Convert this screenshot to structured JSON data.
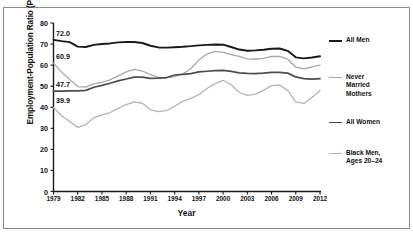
{
  "chart_data": {
    "type": "line",
    "title": "",
    "xlabel": "Year",
    "ylabel": "Employment-Population Ratio (Percent)",
    "xlim": [
      1979,
      2012
    ],
    "ylim": [
      0,
      80
    ],
    "grid": false,
    "legend_position": "right",
    "xticks": [
      "1979",
      "1982",
      "1985",
      "1988",
      "1991",
      "1994",
      "1997",
      "2000",
      "2003",
      "2006",
      "2009",
      "2012"
    ],
    "yticks": [
      "0",
      "10",
      "20",
      "30",
      "40",
      "50",
      "60",
      "70",
      "80"
    ],
    "x": [
      1979,
      1980,
      1981,
      1982,
      1983,
      1984,
      1985,
      1986,
      1987,
      1988,
      1989,
      1990,
      1991,
      1992,
      1993,
      1994,
      1995,
      1996,
      1997,
      1998,
      1999,
      2000,
      2001,
      2002,
      2003,
      2004,
      2005,
      2006,
      2007,
      2008,
      2009,
      2010,
      2011,
      2012
    ],
    "series": [
      {
        "name": "All Men",
        "color": "#1a1a1a",
        "start_label": "72.0",
        "values": [
          72.0,
          71.4,
          70.9,
          68.8,
          68.6,
          69.6,
          70.0,
          70.3,
          70.8,
          71.0,
          71.0,
          70.5,
          69.2,
          68.4,
          68.3,
          68.5,
          68.7,
          69.0,
          69.4,
          69.6,
          69.8,
          69.7,
          68.6,
          67.4,
          66.8,
          67.0,
          67.3,
          67.8,
          67.9,
          66.8,
          63.7,
          63.2,
          63.6,
          64.2
        ]
      },
      {
        "name": "Never\nMarried\nMothers",
        "color": "#a8a8a8",
        "start_label": "60.9",
        "values": [
          60.9,
          56.8,
          53.2,
          49.8,
          49.6,
          51.1,
          51.8,
          53.0,
          54.9,
          56.8,
          58.0,
          57.2,
          55.5,
          54.2,
          54.0,
          54.5,
          55.8,
          58.3,
          62.4,
          65.3,
          66.5,
          66.1,
          65.0,
          64.2,
          63.0,
          62.8,
          63.2,
          64.2,
          64.1,
          62.8,
          59.0,
          58.2,
          59.2,
          60.0
        ]
      },
      {
        "name": "All Women",
        "color": "#4d4d4d",
        "start_label": "47.7",
        "values": [
          47.7,
          47.7,
          47.8,
          47.8,
          48.0,
          49.5,
          50.4,
          51.4,
          52.5,
          53.4,
          54.3,
          54.3,
          53.7,
          53.8,
          54.1,
          55.3,
          55.6,
          56.0,
          56.8,
          57.1,
          57.4,
          57.5,
          57.0,
          56.3,
          56.1,
          56.0,
          56.2,
          56.6,
          56.6,
          56.2,
          54.4,
          53.6,
          53.4,
          53.6
        ]
      },
      {
        "name": "Black Men,\nAges 20–24",
        "color": "#b5b5b5",
        "start_label": "39.9",
        "values": [
          39.9,
          36.0,
          33.2,
          30.5,
          31.8,
          35.0,
          36.4,
          37.5,
          39.5,
          41.3,
          42.6,
          41.9,
          38.8,
          37.9,
          38.4,
          40.5,
          42.8,
          44.2,
          46.0,
          48.9,
          51.2,
          52.8,
          50.7,
          47.0,
          45.6,
          46.2,
          48.0,
          50.3,
          50.6,
          48.0,
          42.5,
          41.8,
          44.6,
          48.0
        ]
      }
    ]
  },
  "legend": {
    "items": [
      {
        "label": "All Men",
        "top": 0
      },
      {
        "label": "Never\nMarried\nMothers",
        "top": 37
      },
      {
        "label": "All Women",
        "top": 82
      },
      {
        "label": "Black Men,\nAges 20–24",
        "top": 113
      }
    ]
  }
}
